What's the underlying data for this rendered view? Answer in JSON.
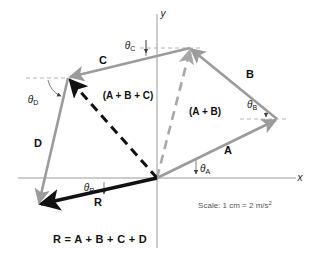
{
  "figure": {
    "type": "vector-addition-diagram",
    "axes": {
      "x_label": "x",
      "y_label": "y",
      "origin_px": [
        157,
        178
      ],
      "axis_color": "#9a9a9a"
    },
    "colors": {
      "vector_gray": "#9b9b9b",
      "resultant_black": "#111111",
      "dashed_gray": "#a8a8a8",
      "dashed_black": "#111111",
      "axis": "#9a9a9a",
      "text": "#111111",
      "note_text": "#555555"
    },
    "vectors": [
      {
        "name": "A",
        "label": "A",
        "style": "solid",
        "color": "#9b9b9b",
        "start_px": [
          157,
          178
        ],
        "end_px": [
          277,
          119
        ],
        "label_px": [
          228,
          150
        ]
      },
      {
        "name": "B",
        "label": "B",
        "style": "solid",
        "color": "#9b9b9b",
        "start_px": [
          277,
          119
        ],
        "end_px": [
          190,
          48
        ],
        "label_px": [
          250,
          74
        ]
      },
      {
        "name": "C",
        "label": "C",
        "style": "solid",
        "color": "#9b9b9b",
        "start_px": [
          190,
          48
        ],
        "end_px": [
          68,
          78
        ],
        "label_px": [
          103,
          60
        ]
      },
      {
        "name": "D",
        "label": "D",
        "style": "solid",
        "color": "#9b9b9b",
        "start_px": [
          68,
          78
        ],
        "end_px": [
          38,
          205
        ],
        "label_px": [
          38,
          143
        ]
      },
      {
        "name": "R",
        "label": "R",
        "style": "solid-bold",
        "color": "#111111",
        "start_px": [
          157,
          178
        ],
        "end_px": [
          38,
          205
        ],
        "label_px": [
          98,
          202
        ]
      }
    ],
    "intermediate_sums": [
      {
        "name": "A-plus-B",
        "label": "(A + B)",
        "style": "dashed",
        "color": "#a8a8a8",
        "start_px": [
          157,
          178
        ],
        "end_px": [
          190,
          48
        ],
        "label_px": [
          205,
          112
        ]
      },
      {
        "name": "A-plus-B-plus-C",
        "label": "(A + B + C)",
        "style": "dashed",
        "color": "#111111",
        "start_px": [
          157,
          178
        ],
        "end_px": [
          68,
          78
        ],
        "label_px": [
          128,
          96
        ]
      }
    ],
    "angles": [
      {
        "name": "theta-A",
        "symbol": "θ",
        "subscript": "A",
        "label_px": [
          205,
          169
        ]
      },
      {
        "name": "theta-B",
        "symbol": "θ",
        "subscript": "B",
        "label_px": [
          252,
          105
        ]
      },
      {
        "name": "theta-C",
        "symbol": "θ",
        "subscript": "C",
        "label_px": [
          130,
          46
        ]
      },
      {
        "name": "theta-D",
        "symbol": "θ",
        "subscript": "D",
        "label_px": [
          33,
          100
        ]
      },
      {
        "name": "theta-R",
        "symbol": "θ",
        "subscript": "R",
        "label_px": [
          89,
          188
        ]
      }
    ],
    "scale_note": {
      "prefix": "Scale: 1 cm = 2 m/s",
      "exponent": "2",
      "label_px": [
        235,
        205
      ]
    },
    "equation": {
      "text": "R = A + B + C + D",
      "label_px": [
        100,
        239
      ]
    }
  }
}
